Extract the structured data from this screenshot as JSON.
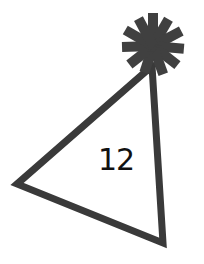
{
  "illustration": {
    "subject": "party-hat",
    "number_label": "12",
    "colors": {
      "stroke": "#3a3a3a",
      "pompom": "#404040",
      "text": "#111111",
      "background": "#ffffff"
    }
  }
}
